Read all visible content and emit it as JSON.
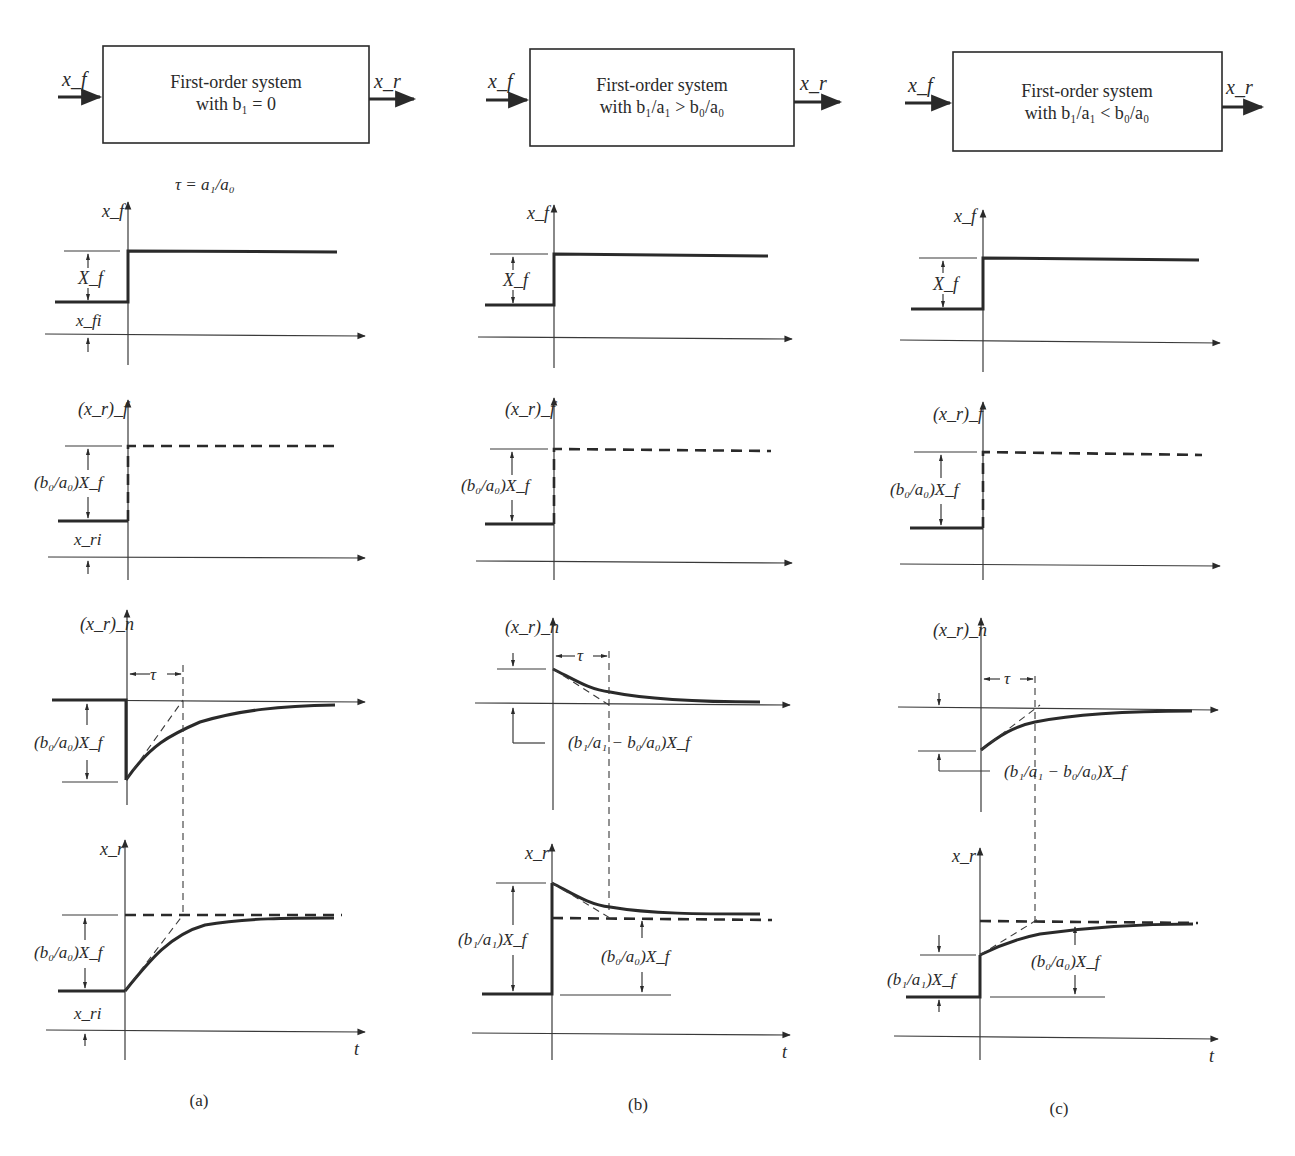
{
  "figure": {
    "panels": [
      {
        "id": "a",
        "caption": "(a)",
        "block": {
          "input_label": "x_f",
          "output_label": "x_r",
          "title_line1": "First-order system",
          "title_line2": "with b₁ = 0"
        },
        "time_constant_note": "τ = a₁/a₀",
        "plots": {
          "forcing": {
            "y_label": "x_f",
            "step_label": "X_f",
            "initial_label": "x_fi"
          },
          "forced_response": {
            "y_label": "(x_r)_f",
            "step_label": "(b₀/a₀)X_f",
            "initial_label": "x_ri"
          },
          "natural_response": {
            "y_label": "(x_r)_n",
            "tau_label": "τ",
            "amplitude_label": "(b₀/a₀)X_f"
          },
          "total_response": {
            "y_label": "x_r",
            "step_label": "(b₀/a₀)X_f",
            "initial_label": "x_ri",
            "x_label": "t"
          }
        }
      },
      {
        "id": "b",
        "caption": "(b)",
        "block": {
          "input_label": "x_f",
          "output_label": "x_r",
          "title_line1": "First-order system",
          "title_line2": "with b₁/a₁ > b₀/a₀"
        },
        "plots": {
          "forcing": {
            "y_label": "x_f",
            "step_label": "X_f"
          },
          "forced_response": {
            "y_label": "(x_r)_f",
            "step_label": "(b₀/a₀)X_f"
          },
          "natural_response": {
            "y_label": "(x_r)_n",
            "tau_label": "τ",
            "amplitude_label": "(b₁/a₁ − b₀/a₀)X_f"
          },
          "total_response": {
            "y_label": "x_r",
            "jump_label": "(b₁/a₁)X_f",
            "final_label": "(b₀/a₀)X_f",
            "x_label": "t"
          }
        }
      },
      {
        "id": "c",
        "caption": "(c)",
        "block": {
          "input_label": "x_f",
          "output_label": "x_r",
          "title_line1": "First-order system",
          "title_line2": "with b₁/a₁ < b₀/a₀"
        },
        "plots": {
          "forcing": {
            "y_label": "x_f",
            "step_label": "X_f"
          },
          "forced_response": {
            "y_label": "(x_r)_f",
            "step_label": "(b₀/a₀)X_f"
          },
          "natural_response": {
            "y_label": "(x_r)_n",
            "tau_label": "τ",
            "amplitude_label": "(b₁/a₁ − b₀/a₀)X_f"
          },
          "total_response": {
            "y_label": "x_r",
            "jump_label": "(b₁/a₁)X_f",
            "final_label": "(b₀/a₀)X_f",
            "x_label": "t"
          }
        }
      }
    ],
    "colors": {
      "ink": "#2a2a2a",
      "background": "#ffffff"
    }
  }
}
